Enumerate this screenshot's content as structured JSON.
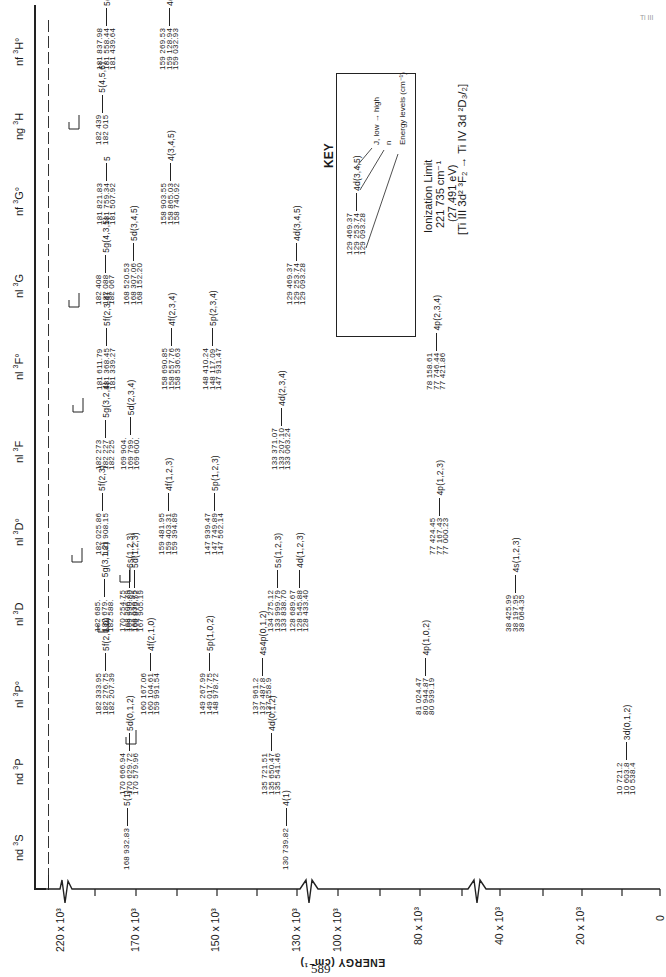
{
  "page": {
    "page_number": "589",
    "corner_label": "Ti III"
  },
  "title": {
    "ionization_limit_label": "Ionization Limit",
    "ionization_limit_cm": "221 735 cm⁻¹",
    "ionization_limit_ev": "(27.491 eV)",
    "configuration": "[Ti III 3d² ³F₂ → Ti IV 3d ²D₃/₂]"
  },
  "key": {
    "heading": "KEY",
    "sample_values": [
      "129 469.37",
      "129 253.74",
      "129 093.28"
    ],
    "sample_term": "4d(3,4,5)",
    "labels": {
      "j": "J, low → high",
      "n": "n",
      "energy": "Energy levels (cm⁻¹)"
    }
  },
  "axis": {
    "label": "ENERGY (cm⁻¹)",
    "ticks": [
      "220 x 10³",
      "170 x 10³",
      "150 x 10³",
      "130 x 10³",
      "100 x 10³",
      "80 x 10³",
      "40 x 10³",
      "20 x 10³",
      "0"
    ]
  },
  "columns": [
    {
      "id": "nd-3S",
      "label": "nd",
      "sup": "3",
      "term": "S"
    },
    {
      "id": "nd-3P",
      "label": "nd",
      "sup": "3",
      "term": "P"
    },
    {
      "id": "nl-3Po",
      "label": "nl",
      "sup": "3",
      "term": "P°"
    },
    {
      "id": "nl-3D",
      "label": "nl",
      "sup": "3",
      "term": "D"
    },
    {
      "id": "nl-3Do",
      "label": "nl",
      "sup": "3",
      "term": "D°"
    },
    {
      "id": "nl-3F",
      "label": "nl",
      "sup": "3",
      "term": "F"
    },
    {
      "id": "nl-3Fo",
      "label": "nl",
      "sup": "3",
      "term": "F°"
    },
    {
      "id": "nl-3G",
      "label": "nl",
      "sup": "3",
      "term": "G"
    },
    {
      "id": "nf-3Go",
      "label": "nf",
      "sup": "3",
      "term": "G°"
    },
    {
      "id": "ng-3H",
      "label": "ng",
      "sup": "3",
      "term": "H"
    },
    {
      "id": "nf-3Ho",
      "label": "nf",
      "sup": "3",
      "term": "H°"
    }
  ],
  "levels": [
    {
      "col": "nd-3S",
      "values": [
        "168 932.83"
      ],
      "term": "5(1)"
    },
    {
      "col": "nd-3S",
      "values": [
        "130 739.82"
      ],
      "term": "4(1)"
    },
    {
      "col": "nd-3P",
      "values": [
        "170 666.94",
        "170 629.72",
        "170 579.96"
      ],
      "term": "5d(0,1,2)"
    },
    {
      "col": "nd-3P",
      "values": [
        "135 721.51",
        "135 650.47",
        "135 541.46"
      ],
      "term": "4d(0,1,2)"
    },
    {
      "col": "nd-3P",
      "values": [
        "10 721.2",
        "10 603.8",
        "10 538.4"
      ],
      "term": "3d(0,1,2)"
    },
    {
      "col": "nl-3Po",
      "values": [
        "182 333.95",
        "182 276.75",
        "182 207.39"
      ],
      "term": "5f(2,1,0)"
    },
    {
      "col": "nl-3Po",
      "values": [
        "160 167.06",
        "160 104.61",
        "159 991.54"
      ],
      "term": "4f(2,1,0)"
    },
    {
      "col": "nl-3Po",
      "values": [
        "149 267.99",
        "149 017.75",
        "148 978.72"
      ],
      "term": "5p(1,0,2)"
    },
    {
      "col": "nl-3Po",
      "values": [
        "137 961.2",
        "137 487.8",
        "137 258.9"
      ],
      "term": "4s4p(0,1,2)"
    },
    {
      "col": "nl-3Po",
      "values": [
        "81 024.47",
        "80 944.87",
        "80 939.19"
      ],
      "term": "4p(1,0,2)"
    },
    {
      "col": "nl-3D",
      "values": [
        "182 685.",
        "182 679.",
        "182 588."
      ],
      "term": "5g(3,1,2)"
    },
    {
      "col": "nl-3D",
      "values": [
        "170 254.75",
        "169 930.80",
        "169 875.52"
      ],
      "term": "6s(1,2,3)"
    },
    {
      "col": "nl-3D",
      "values": [
        "168 206.79",
        "168 030.75",
        "167 905.19"
      ],
      "term": "5d(1,2,3)"
    },
    {
      "col": "nl-3D",
      "values": [
        "134 275.12",
        "133 999.79",
        "133 838.70"
      ],
      "term": "5s(1,2,3)"
    },
    {
      "col": "nl-3D",
      "values": [
        "128 689.67",
        "128 545.88",
        "128 433.40"
      ],
      "term": "4d(1,2,3)"
    },
    {
      "col": "nl-3D",
      "values": [
        "38 425.99",
        "38 197.95",
        "38 064.35"
      ],
      "term": "4s(1,2,3)"
    },
    {
      "col": "nl-3Do",
      "values": [
        "182 025.86",
        "181 908.15"
      ],
      "term": "5f(2,3)"
    },
    {
      "col": "nl-3Do",
      "values": [
        "159 481.95",
        "159 403.31",
        "159 394.89"
      ],
      "term": "4f(1,2,3)"
    },
    {
      "col": "nl-3Do",
      "values": [
        "147 939.47",
        "147 749.89",
        "147 562.14"
      ],
      "term": "5p(1,2,3)"
    },
    {
      "col": "nl-3Do",
      "values": [
        "77 424.45",
        "77 167.43",
        "77 000.23"
      ],
      "term": "4p(1,2,3)"
    },
    {
      "col": "nl-3F",
      "values": [
        "182 273",
        "182 227",
        "182 225"
      ],
      "term": "5g(3,2,4)"
    },
    {
      "col": "nl-3F",
      "values": [
        "169 904.",
        "169 799.",
        "169 600."
      ],
      "term": "5d(2,3,4)"
    },
    {
      "col": "nl-3F",
      "values": [
        "133 371.07",
        "133 207.10",
        "133 063.24"
      ],
      "term": "4d(2,3,4)"
    },
    {
      "col": "nl-3Fo",
      "values": [
        "181 611.79",
        "181 368.45",
        "181 339.27"
      ],
      "term": "5f(2,3,4)"
    },
    {
      "col": "nl-3Fo",
      "values": [
        "158 690.85",
        "158 557.76",
        "158 536.63"
      ],
      "term": "4f(2,3,4)"
    },
    {
      "col": "nl-3Fo",
      "values": [
        "148 410.24",
        "148 117.09",
        "147 931.47"
      ],
      "term": "5p(2,3,4)"
    },
    {
      "col": "nl-3Fo",
      "values": [
        "78 158.61",
        "77 746.44",
        "77 421.86"
      ],
      "term": "4p(2,3,4)"
    },
    {
      "col": "nl-3G",
      "values": [
        "182 408",
        "182 088",
        "182 067"
      ],
      "term": "5g(4,3,5)"
    },
    {
      "col": "nl-3G",
      "values": [
        "168 520.53",
        "168 307.06",
        "168 152.20"
      ],
      "term": "5d(3,4,5)"
    },
    {
      "col": "nl-3G",
      "values": [
        "129 469.37",
        "129 253.74",
        "129 093.28"
      ],
      "term": "4d(3,4,5)"
    },
    {
      "col": "nf-3Go",
      "values": [
        "181 821.83",
        "181 759.34",
        "181 507.92"
      ],
      "term": "5"
    },
    {
      "col": "nf-3Go",
      "values": [
        "158 903.55",
        "158 865.03",
        "158 740.92"
      ],
      "term": "4(3,4,5)"
    },
    {
      "col": "ng-3H",
      "values": [
        "182 439",
        "182 015"
      ],
      "term": "5(4,5,6)"
    },
    {
      "col": "nf-3Ho",
      "values": [
        "181 837.98",
        "181 558.44",
        "181 439.64"
      ],
      "term": "5(4,5,6)"
    },
    {
      "col": "nf-3Ho",
      "values": [
        "159 269.53",
        "159 128.94",
        "159 032.93"
      ],
      "term": "4(4,5,6)"
    }
  ],
  "chart_data": {
    "type": "energy-level-diagram",
    "xlabel": "ENERGY (cm⁻¹)",
    "axis_ticks_cm": [
      220000,
      170000,
      150000,
      130000,
      100000,
      80000,
      40000,
      20000,
      0
    ],
    "axis_breaks_between": [
      [
        220000,
        170000
      ],
      [
        130000,
        100000
      ],
      [
        80000,
        40000
      ]
    ],
    "ionization_limit_cm": 221735,
    "ionization_limit_ev": 27.491,
    "series": [
      {
        "name": "nd 3S",
        "levels": [
          {
            "term": "5(1)",
            "E": [
              168932.83
            ]
          },
          {
            "term": "4(1)",
            "E": [
              130739.82
            ]
          }
        ]
      },
      {
        "name": "nd 3P",
        "levels": [
          {
            "term": "5d(0,1,2)",
            "E": [
              170666.94,
              170629.72,
              170579.96
            ]
          },
          {
            "term": "4d(0,1,2)",
            "E": [
              135721.51,
              135650.47,
              135541.46
            ]
          },
          {
            "term": "3d(0,1,2)",
            "E": [
              10721.2,
              10603.8,
              10538.4
            ]
          }
        ]
      },
      {
        "name": "nl 3P°",
        "levels": [
          {
            "term": "5f(2,1,0)",
            "E": [
              182333.95,
              182276.75,
              182207.39
            ]
          },
          {
            "term": "4f(2,1,0)",
            "E": [
              160167.06,
              160104.61,
              159991.54
            ]
          },
          {
            "term": "5p(1,0,2)",
            "E": [
              149267.99,
              149017.75,
              148978.72
            ]
          },
          {
            "term": "4s4p(0,1,2)",
            "E": [
              137961.2,
              137487.8,
              137258.9
            ]
          },
          {
            "term": "4p(1,0,2)",
            "E": [
              81024.47,
              80944.87,
              80939.19
            ]
          }
        ]
      },
      {
        "name": "nl 3D",
        "levels": [
          {
            "term": "5g(3,1,2)",
            "E": [
              182685,
              182679,
              182588
            ]
          },
          {
            "term": "6s(1,2,3)",
            "E": [
              170254.75,
              169930.8,
              169875.52
            ]
          },
          {
            "term": "5d(1,2,3)",
            "E": [
              168206.79,
              168030.75,
              167905.19
            ]
          },
          {
            "term": "5s(1,2,3)",
            "E": [
              134275.12,
              133999.79,
              133838.7
            ]
          },
          {
            "term": "4d(1,2,3)",
            "E": [
              128689.67,
              128545.88,
              128433.4
            ]
          },
          {
            "term": "4s(1,2,3)",
            "E": [
              38425.99,
              38197.95,
              38064.35
            ]
          }
        ]
      },
      {
        "name": "nl 3D°",
        "levels": [
          {
            "term": "5f(2,3)",
            "E": [
              182025.86,
              181908.15
            ]
          },
          {
            "term": "4f(1,2,3)",
            "E": [
              159481.95,
              159403.31,
              159394.89
            ]
          },
          {
            "term": "5p(1,2,3)",
            "E": [
              147939.47,
              147749.89,
              147562.14
            ]
          },
          {
            "term": "4p(1,2,3)",
            "E": [
              77424.45,
              77167.43,
              77000.23
            ]
          }
        ]
      },
      {
        "name": "nl 3F",
        "levels": [
          {
            "term": "5g(3,2,4)",
            "E": [
              182273,
              182227,
              182225
            ]
          },
          {
            "term": "5d(2,3,4)",
            "E": [
              169904,
              169799,
              169600
            ]
          },
          {
            "term": "4d(2,3,4)",
            "E": [
              133371.07,
              133207.1,
              133063.24
            ]
          }
        ]
      },
      {
        "name": "nl 3F°",
        "levels": [
          {
            "term": "5f(2,3,4)",
            "E": [
              181611.79,
              181368.45,
              181339.27
            ]
          },
          {
            "term": "4f(2,3,4)",
            "E": [
              158690.85,
              158557.76,
              158536.63
            ]
          },
          {
            "term": "5p(2,3,4)",
            "E": [
              148410.24,
              148117.09,
              147931.47
            ]
          },
          {
            "term": "4p(2,3,4)",
            "E": [
              78158.61,
              77746.44,
              77421.86
            ]
          }
        ]
      },
      {
        "name": "nl 3G",
        "levels": [
          {
            "term": "5g(4,3,5)",
            "E": [
              182408,
              182088,
              182067
            ]
          },
          {
            "term": "5d(3,4,5)",
            "E": [
              168520.53,
              168307.06,
              168152.2
            ]
          },
          {
            "term": "4d(3,4,5)",
            "E": [
              129469.37,
              129253.74,
              129093.28
            ]
          }
        ]
      },
      {
        "name": "nf 3G°",
        "levels": [
          {
            "term": "5",
            "E": [
              181821.83,
              181759.34,
              181507.92
            ]
          },
          {
            "term": "4(3,4,5)",
            "E": [
              158903.55,
              158865.03,
              158740.92
            ]
          }
        ]
      },
      {
        "name": "ng 3H",
        "levels": [
          {
            "term": "5(4,5,6)",
            "E": [
              182439,
              182015
            ]
          }
        ]
      },
      {
        "name": "nf 3H°",
        "levels": [
          {
            "term": "5(4,5,6)",
            "E": [
              181837.98,
              181558.44,
              181439.64
            ]
          },
          {
            "term": "4(4,5,6)",
            "E": [
              159269.53,
              159128.94,
              159032.93
            ]
          }
        ]
      }
    ]
  }
}
